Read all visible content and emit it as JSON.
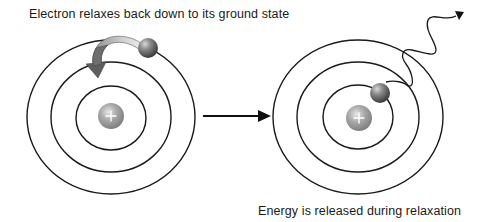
{
  "diagram": {
    "captions": {
      "top": "Electron relaxes back down to its ground state",
      "bottom": "Energy is released during relaxation"
    },
    "colors": {
      "orbit_stroke": "#1a1a1a",
      "nucleus_fill": "#9a9a9a",
      "electron_fill": "#7a7a7a",
      "transition_arrow_fill": "#6e6e6e",
      "transition_arrow_tail": "#d8d8d8",
      "process_arrow": "#111111",
      "text": "#1a1a1a",
      "background": "#ffffff"
    },
    "atoms": [
      {
        "id": "before",
        "orbits": 3,
        "nucleus_symbol": "+",
        "electron_shell": "outer",
        "annotation": "downward curved arrow from outer to middle shell"
      },
      {
        "id": "after",
        "orbits": 3,
        "nucleus_symbol": "+",
        "electron_shell": "inner",
        "annotation": "wavy photon arrow emitted outward"
      }
    ],
    "process_arrow": {
      "direction": "left-to-right"
    }
  }
}
